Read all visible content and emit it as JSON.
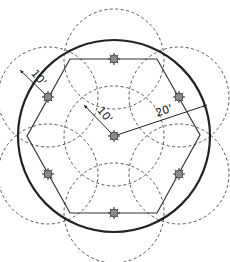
{
  "diagram": {
    "colors": {
      "outline": "#222222",
      "dashed": "#555555",
      "sprinkler_fill": "#8a8a8a",
      "background": "#ffffff"
    },
    "main_circle": {
      "cx": 114,
      "cy": 136,
      "r": 96
    },
    "hexagon_vertices": [
      [
        70,
        59
      ],
      [
        157,
        59
      ],
      [
        200,
        135
      ],
      [
        157,
        213
      ],
      [
        70,
        213
      ],
      [
        27,
        136
      ]
    ],
    "coverage_radius_px": 50,
    "sprinklers": [
      {
        "id": "center",
        "x": 114,
        "y": 136
      },
      {
        "id": "top",
        "x": 114,
        "y": 59
      },
      {
        "id": "upper-right",
        "x": 179,
        "y": 97
      },
      {
        "id": "lower-right",
        "x": 179,
        "y": 174
      },
      {
        "id": "bottom",
        "x": 114,
        "y": 213
      },
      {
        "id": "lower-left",
        "x": 48,
        "y": 174
      },
      {
        "id": "upper-left",
        "x": 48,
        "y": 97
      }
    ],
    "dimensions": [
      {
        "label": "10'",
        "x1": 20,
        "y1": 70,
        "x2": 48,
        "y2": 97,
        "tx": 36,
        "ty": 80,
        "rot": 50
      },
      {
        "label": "10'",
        "x1": 84,
        "y1": 105,
        "x2": 114,
        "y2": 136,
        "tx": 102,
        "ty": 117,
        "rot": 50
      },
      {
        "label": "20'",
        "x1": 114,
        "y1": 136,
        "x2": 207,
        "y2": 105,
        "tx": 165,
        "ty": 114,
        "rot": -18
      }
    ]
  }
}
